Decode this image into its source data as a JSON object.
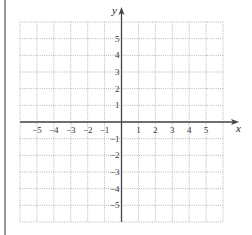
{
  "diagram": {
    "type": "coordinate-grid",
    "x_axis": {
      "label": "x",
      "min": -6,
      "max": 6,
      "tick_labels": [
        "−5",
        "−4",
        "−3",
        "−2",
        "−1",
        "1",
        "2",
        "3",
        "4",
        "5"
      ]
    },
    "y_axis": {
      "label": "y",
      "min": -6,
      "max": 6,
      "tick_labels": [
        "5",
        "4",
        "3",
        "2",
        "1",
        "−1",
        "−2",
        "−3",
        "−4",
        "−5"
      ]
    },
    "grid": {
      "columns": 12,
      "rows": 12,
      "style": "dotted"
    },
    "colors": {
      "grid": "#b5b5b5",
      "axis": "#444444",
      "frame": "#9a9a9a"
    }
  }
}
